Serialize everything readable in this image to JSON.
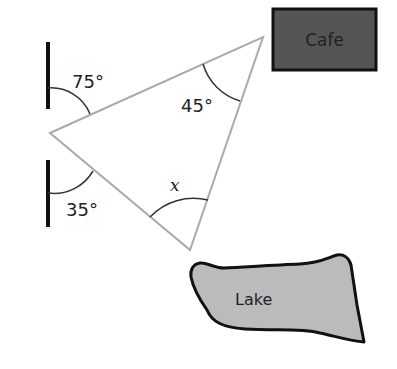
{
  "diagram": {
    "type": "geometry-map",
    "angles": {
      "upper_wall_angle": "75°",
      "lower_wall_angle": "35°",
      "top_vertex_angle": "45°",
      "bottom_vertex_angle": "x"
    },
    "places": {
      "cafe": "Cafe",
      "lake": "Lake"
    },
    "colors": {
      "triangle_stroke": "#aaaaaa",
      "wall": "#111111",
      "arc": "#333333",
      "cafe_fill": "#555555",
      "cafe_border": "#111111",
      "lake_fill": "#bbbbbb",
      "lake_border": "#111111",
      "background": "#ffffff"
    }
  }
}
